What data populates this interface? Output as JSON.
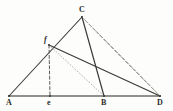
{
  "figure": {
    "background_color": "#fdfdfb",
    "ink_color": "#2b2b2b",
    "faint_ink_color": "#9a9a96",
    "width": 173,
    "height": 111,
    "points": [
      {
        "id": "A",
        "label": "A",
        "x": 9,
        "y": 96,
        "label_x": 6,
        "label_y": 105,
        "style": "upright"
      },
      {
        "id": "E",
        "label": "e",
        "x": 50,
        "y": 96,
        "label_x": 47,
        "label_y": 105,
        "style": "upright"
      },
      {
        "id": "B",
        "label": "B",
        "x": 104,
        "y": 96,
        "label_x": 101,
        "label_y": 105,
        "style": "upright"
      },
      {
        "id": "D",
        "label": "D",
        "x": 160,
        "y": 96,
        "label_x": 157,
        "label_y": 105,
        "style": "upright"
      },
      {
        "id": "C",
        "label": "C",
        "x": 82,
        "y": 17,
        "label_x": 79,
        "label_y": 12,
        "style": "upright"
      },
      {
        "id": "F",
        "label": "f",
        "x": 49,
        "y": 45,
        "label_x": 44,
        "label_y": 42,
        "style": "italic"
      }
    ],
    "segments": [
      {
        "name": "baseline-A-D",
        "from": "A",
        "to": "D",
        "stroke": "solid",
        "color": "#6e6e6a",
        "width": 1.6
      },
      {
        "name": "side-A-C",
        "from": "A",
        "to": "C",
        "stroke": "solid",
        "color": "#3a3a38",
        "width": 1.1
      },
      {
        "name": "cevian-C-B",
        "from": "C",
        "to": "B",
        "stroke": "solid",
        "color": "#3a3a38",
        "width": 1.2
      },
      {
        "name": "chord-F-D",
        "from": "F",
        "to": "D",
        "stroke": "solid",
        "color": "#3a3a38",
        "width": 1.2
      },
      {
        "name": "dashed-C-D",
        "from": "C",
        "to": "D",
        "stroke": "dashed",
        "color": "#4a4a47",
        "width": 1.0
      },
      {
        "name": "dashed-C-D-alt",
        "from": "C",
        "to": "D",
        "stroke": "dashed",
        "color": "#a9a9a4",
        "width": 1.0
      },
      {
        "name": "altitude-F-E",
        "from": "F",
        "to": "E",
        "stroke": "dashed",
        "color": "#5c5c58",
        "width": 1.0
      },
      {
        "name": "dotted-F-B",
        "from": "F",
        "to": "B",
        "stroke": "dotted",
        "color": "#b2b2ad",
        "width": 1.0
      }
    ],
    "labels_caption": ""
  }
}
